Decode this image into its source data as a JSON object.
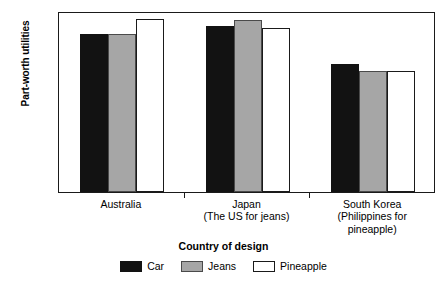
{
  "chart_data": {
    "type": "bar",
    "title": "",
    "xlabel": "Country of design",
    "ylabel": "Part-worth utilities",
    "categories": [
      "Australia",
      "Japan",
      "South Korea"
    ],
    "category_sublabels": [
      [],
      [
        "(The US for jeans)"
      ],
      [
        "(Philippines for",
        "pineapple)"
      ]
    ],
    "series": [
      {
        "name": "Car",
        "color": "#121212",
        "values": [
          1.05,
          1.1,
          0.85
        ]
      },
      {
        "name": "Jeans",
        "color": "#a6a6a6",
        "values": [
          1.05,
          1.14,
          0.8
        ]
      },
      {
        "name": "Pineapple",
        "color": "#ffffff",
        "values": [
          1.15,
          1.09,
          0.8
        ]
      }
    ],
    "ylim": [
      0,
      1.2
    ],
    "yticks": [
      "0",
      "0.2",
      "0.4",
      "0.6",
      "0.8",
      "1.0",
      "1.2"
    ],
    "ytick_values": [
      0,
      0.2,
      0.4,
      0.6,
      0.8,
      1.0,
      1.2
    ],
    "grid": false,
    "legend_position": "bottom"
  },
  "legend": {
    "items": [
      {
        "label": "Car"
      },
      {
        "label": "Jeans"
      },
      {
        "label": "Pineapple"
      }
    ]
  }
}
